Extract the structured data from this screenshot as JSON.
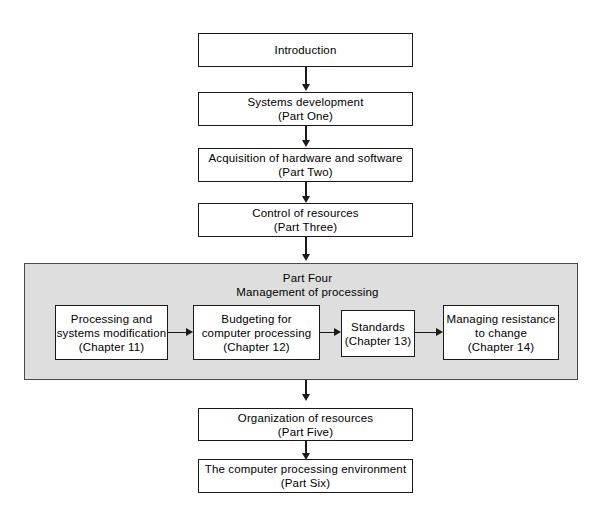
{
  "diagram": {
    "colors": {
      "background": "#ffffff",
      "box_fill": "#ffffff",
      "box_border": "#1a1a1a",
      "panel_fill": "#dedede",
      "panel_border": "#4a4a4a",
      "text": "#000000",
      "arrow": "#1a1a1a"
    }
  },
  "main_flow": [
    {
      "id": "introduction",
      "line1": "Introduction",
      "line2": ""
    },
    {
      "id": "systems-development",
      "line1": "Systems development",
      "line2": "(Part One)"
    },
    {
      "id": "acquisition",
      "line1": "Acquisition of hardware and software",
      "line2": "(Part Two)"
    },
    {
      "id": "control-of-resources",
      "line1": "Control of resources",
      "line2": "(Part Three)"
    },
    {
      "id": "organization-of-resources",
      "line1": "Organization of resources",
      "line2": "(Part Five)"
    },
    {
      "id": "computer-processing-environment",
      "line1": "The computer processing environment",
      "line2": "(Part Six)"
    }
  ],
  "part_four": {
    "heading_line1": "Part Four",
    "heading_line2": "Management of processing",
    "chapters": [
      {
        "id": "processing-and-systems-modification",
        "line1": "Processing and",
        "line2": "systems modification",
        "line3": "(Chapter 11)"
      },
      {
        "id": "budgeting-for-computer-processing",
        "line1": "Budgeting for",
        "line2": "computer processing",
        "line3": "(Chapter 12)"
      },
      {
        "id": "standards",
        "line1": "Standards",
        "line2": "(Chapter 13)",
        "line3": ""
      },
      {
        "id": "managing-resistance-to-change",
        "line1": "Managing resistance",
        "line2": "to change",
        "line3": "(Chapter 14)"
      }
    ]
  }
}
